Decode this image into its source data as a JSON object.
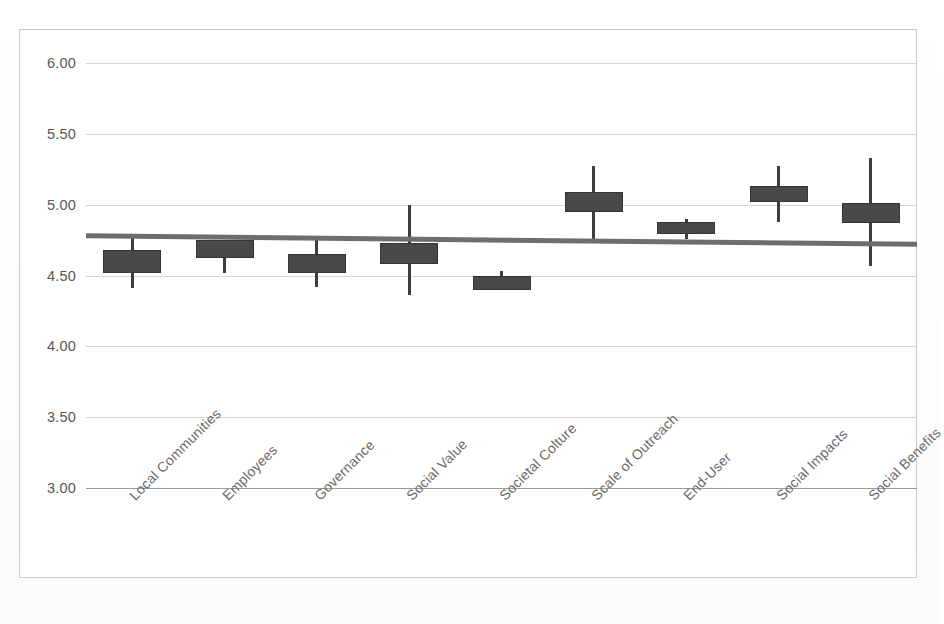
{
  "chart_data": {
    "type": "box",
    "title": "",
    "subtitle": "",
    "xlabel": "",
    "ylabel": "",
    "ylim": [
      3.0,
      6.0
    ],
    "yticks": [
      "6.00",
      "5.50",
      "5.00",
      "4.50",
      "4.00",
      "3.50",
      "3.00"
    ],
    "ytick_values": [
      6.0,
      5.5,
      5.0,
      4.5,
      4.0,
      3.5,
      3.0
    ],
    "grid": "horizontal",
    "legend": "none",
    "categories": [
      "Local Communities",
      "Employees",
      "Governance",
      "Social Value",
      "Societal Colture",
      "Scale of Outreach",
      "End-User",
      "Social Impacts",
      "Social Benefits"
    ],
    "series": [
      {
        "name": "Rating distribution",
        "points": [
          {
            "category": "Local Communities",
            "whisker_low": 4.41,
            "box_low": 4.52,
            "median": 4.6,
            "box_high": 4.68,
            "whisker_high": 4.79
          },
          {
            "category": "Employees",
            "whisker_low": 4.52,
            "box_low": 4.62,
            "median": 4.69,
            "box_high": 4.75,
            "whisker_high": 4.75
          },
          {
            "category": "Governance",
            "whisker_low": 4.42,
            "box_low": 4.52,
            "median": 4.59,
            "box_high": 4.65,
            "whisker_high": 4.77
          },
          {
            "category": "Social Value",
            "whisker_low": 4.36,
            "box_low": 4.58,
            "median": 4.66,
            "box_high": 4.73,
            "whisker_high": 5.0
          },
          {
            "category": "Societal Colture",
            "whisker_low": 4.42,
            "box_low": 4.4,
            "median": 4.44,
            "box_high": 4.5,
            "whisker_high": 4.53
          },
          {
            "category": "Scale of Outreach",
            "whisker_low": 4.75,
            "box_low": 4.95,
            "median": 5.01,
            "box_high": 5.09,
            "whisker_high": 5.27
          },
          {
            "category": "End-User",
            "whisker_low": 4.76,
            "box_low": 4.79,
            "median": 4.83,
            "box_high": 4.88,
            "whisker_high": 4.9
          },
          {
            "category": "Social Impacts",
            "whisker_low": 4.88,
            "box_low": 5.02,
            "median": 5.07,
            "box_high": 5.13,
            "whisker_high": 5.27
          },
          {
            "category": "Social Benefits",
            "whisker_low": 4.57,
            "box_low": 4.87,
            "median": 4.94,
            "box_high": 5.01,
            "whisker_high": 5.33
          }
        ]
      }
    ],
    "trend_line": {
      "name": "overall mean",
      "y_start": 4.78,
      "y_end": 4.72,
      "color": "#6e6e6e"
    },
    "colors": {
      "box_fill": "#494949",
      "box_edge": "#343434",
      "whisker": "#3d3d3d",
      "gridline": "#d5d5d5",
      "baseline": "#9a9a9a",
      "frame": "#c9c9c9",
      "tick_text": "#575757",
      "label_text": "#6a6a6a"
    }
  },
  "caption": {
    "text": ""
  }
}
